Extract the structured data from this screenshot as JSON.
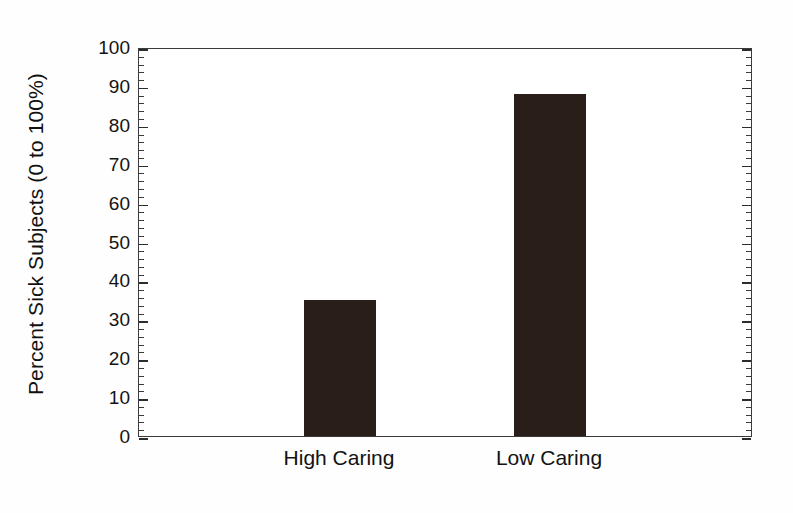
{
  "chart_data": {
    "type": "bar",
    "title": "",
    "subtitle": "",
    "categories": [
      "High Caring",
      "Low Caring"
    ],
    "values": [
      35,
      88
    ],
    "series": [
      {
        "name": "Percent Sick Subjects",
        "values": [
          35,
          88
        ]
      }
    ],
    "xlabel": "",
    "ylabel": "Percent Sick Subjects (0 to 100%)",
    "ylim": [
      0,
      100
    ],
    "yticks": [
      0,
      10,
      20,
      30,
      40,
      50,
      60,
      70,
      80,
      90,
      100
    ],
    "ytick_labels": [
      "0",
      "10",
      "20",
      "30",
      "40",
      "50",
      "60",
      "70",
      "80",
      "90",
      "100"
    ],
    "y_minor_tick_step": 2,
    "grid": false,
    "legend": null,
    "legend_position": "none",
    "bar_color": "#2a1e1a",
    "axis_color": "#3a3a3a",
    "background_color": "#ffffff",
    "annotations": []
  }
}
